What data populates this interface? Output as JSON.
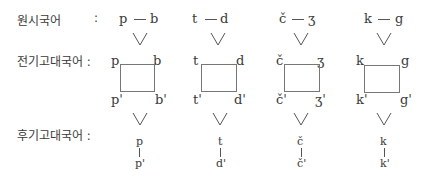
{
  "labels": {
    "proto": "원시국어",
    "proto_colon": ":",
    "early": "전기고대국어 :",
    "late": "후기고대국어 :"
  },
  "columns": [
    {
      "voiceless": "p",
      "voiced": "b",
      "voiceless_prime": "p'",
      "voiced_prime": "b'",
      "late_top": "p",
      "late_bottom": "p'"
    },
    {
      "voiceless": "t",
      "voiced": "d",
      "voiceless_prime": "t'",
      "voiced_prime": "d'",
      "late_top": "t",
      "late_bottom": "d'"
    },
    {
      "voiceless": "č",
      "voiced": "ʒ",
      "voiceless_prime": "č'",
      "voiced_prime": "ʒ'",
      "late_top": "č",
      "late_bottom": "č'"
    },
    {
      "voiceless": "k",
      "voiced": "g",
      "voiceless_prime": "k'",
      "voiced_prime": "g'",
      "late_top": "k",
      "late_bottom": "k'"
    }
  ],
  "symbols": {
    "dash": "—",
    "merge": "∨"
  }
}
